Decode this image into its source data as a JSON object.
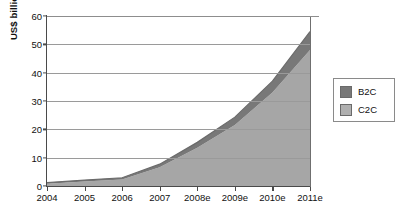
{
  "chart_data": {
    "type": "area",
    "stacked": true,
    "title": "",
    "subtitle": "",
    "xlabel": "",
    "ylabel": "US$ billion",
    "categories": [
      "2004",
      "2005",
      "2006",
      "2007",
      "2008e",
      "2009e",
      "2010e",
      "2011e"
    ],
    "series": [
      {
        "name": "C2C",
        "color": "#a6a6a6",
        "values": [
          0.8,
          1.6,
          2.3,
          6.6,
          13.5,
          21.5,
          33.0,
          48.0
        ]
      },
      {
        "name": "B2C",
        "color": "#787878",
        "values": [
          0.4,
          0.5,
          0.6,
          1.1,
          1.9,
          2.8,
          4.0,
          6.5
        ]
      }
    ],
    "totals": [
      1.2,
      2.1,
      2.9,
      7.7,
      15.4,
      24.3,
      37.0,
      54.5
    ],
    "ylim": [
      0,
      60
    ],
    "yticks": [
      0,
      10,
      20,
      30,
      40,
      50,
      60
    ],
    "ytick_labels": [
      "0",
      "10",
      "20",
      "30",
      "40",
      "50",
      "60"
    ],
    "grid": true,
    "grid_axis": "y",
    "legend_position": "right"
  },
  "legend": {
    "items": [
      {
        "label": "B2C",
        "color": "#787878"
      },
      {
        "label": "C2C",
        "color": "#b0b0b0"
      }
    ]
  },
  "axes": {
    "y_title": "US$ billion"
  }
}
